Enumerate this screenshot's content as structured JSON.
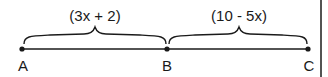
{
  "diagram": {
    "segments": [
      {
        "from": "A",
        "to": "B",
        "label": "(3x + 2)"
      },
      {
        "from": "B",
        "to": "C",
        "label": "(10 - 5x)"
      }
    ],
    "points": [
      {
        "name": "A",
        "x": 22
      },
      {
        "name": "B",
        "x": 167
      },
      {
        "name": "C",
        "x": 308
      }
    ],
    "colors": {
      "ink": "#1a1a1a",
      "background": "#ffffff"
    }
  }
}
